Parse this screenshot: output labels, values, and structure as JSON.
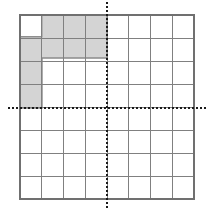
{
  "figure": {
    "colors": {
      "background": "#ffffff",
      "grid_line": "#808080",
      "grid_border": "#707070",
      "axis": "#1a1a1a",
      "shape_fill": "#d4d4d4",
      "shape_stroke": "#8a8a8a"
    }
  },
  "chart_data": {
    "type": "diagram",
    "title": "",
    "xlabel": "",
    "ylabel": "",
    "grid": {
      "visible": true,
      "columns": 8,
      "rows": 8,
      "cell_size_px": 21.75,
      "left_px": 20,
      "top_px": 15,
      "right_px": 194,
      "bottom_px": 199
    },
    "axes": {
      "style": "dashed",
      "x_axis": {
        "visible": true,
        "y_px": 108,
        "row_index": 4.28,
        "x_start_px": 8,
        "x_end_px": 208,
        "tick_labels": []
      },
      "y_axis": {
        "visible": true,
        "x_px": 107,
        "column_index": 4.0,
        "y_start_px": 2,
        "y_end_px": 209,
        "tick_labels": []
      },
      "origin_px": {
        "x": 107,
        "y": 108
      }
    },
    "shaded_region": {
      "label": "shaded-staircase-polygon",
      "fill": "#d4d4d4",
      "stroke": "#8a8a8a",
      "outline_px": [
        [
          20,
          15
        ],
        [
          107,
          15
        ],
        [
          107,
          58
        ],
        [
          42,
          58
        ],
        [
          42,
          108
        ],
        [
          20,
          108
        ]
      ],
      "notch_px": {
        "label": "white-notch-cell",
        "x": 20,
        "y": 15,
        "width": 21.75,
        "height": 21.75,
        "fill": "#ffffff"
      },
      "area_cells": 11,
      "legend": []
    }
  }
}
